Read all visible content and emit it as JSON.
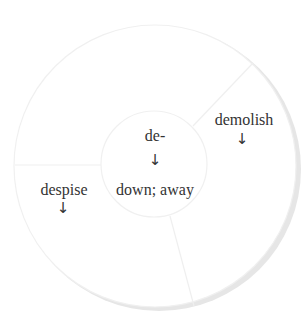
{
  "diagram": {
    "type": "word-root-wheel",
    "center": {
      "root": "de-",
      "arrow": "↓",
      "meaning": "down; away"
    },
    "segments": [
      {
        "word": "demolish",
        "arrow": "↓"
      },
      {
        "word": "despise",
        "arrow": "↓"
      },
      {
        "word": "",
        "arrow": ""
      }
    ],
    "colors": {
      "text": "#333333",
      "divider": "#eeeeee",
      "shadow": "#e6e6e6",
      "fill": "#ffffff"
    }
  }
}
